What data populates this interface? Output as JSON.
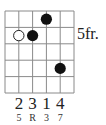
{
  "chord_diagram": {
    "type": "guitar-chord-chart",
    "strings": 6,
    "frets_shown": 5,
    "start_fret_label": "5fr.",
    "start_fret_row": 2,
    "colors": {
      "grid": "#8a8a8a",
      "dot": "#111111",
      "open_dot_stroke": "#222222",
      "text": "#222222"
    },
    "dots": [
      {
        "string": 2,
        "fret_row": 2,
        "style": "hollow",
        "finger": "2",
        "interval": "5"
      },
      {
        "string": 3,
        "fret_row": 2,
        "style": "filled",
        "finger": "3",
        "interval": "R"
      },
      {
        "string": 4,
        "fret_row": 1,
        "style": "filled",
        "finger": "1",
        "interval": "3"
      },
      {
        "string": 5,
        "fret_row": 4,
        "style": "filled",
        "finger": "4",
        "interval": "7"
      }
    ],
    "finger_labels": [
      "2",
      "3",
      "1",
      "4"
    ],
    "interval_labels": [
      "5",
      "R",
      "3",
      "7"
    ]
  }
}
